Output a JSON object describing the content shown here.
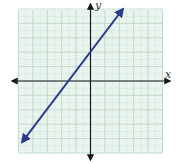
{
  "chart_data": {
    "type": "line",
    "title": "",
    "xlabel": "x",
    "ylabel": "y",
    "xlim": [
      -10,
      10
    ],
    "ylim": [
      -10,
      10
    ],
    "grid": true,
    "grid_minor_step": 1,
    "grid_major_step": 2,
    "tick_labels": false,
    "series": [
      {
        "name": "line",
        "description": "straight line with arrows on both ends, y ≈ (4/3)x + 4",
        "x_intercept": -3,
        "y_intercept": 4,
        "slope": 1.333,
        "endpoints": [
          [
            -9.5,
            -8.5
          ],
          [
            4.5,
            10
          ]
        ],
        "color": "#2b3a8c"
      }
    ]
  },
  "labels": {
    "x_axis": "x",
    "y_axis": "y"
  },
  "colors": {
    "grid_background": "#eaf4ee",
    "grid_line": "#b9d3c3",
    "axis": "#1a1a1a",
    "line": "#2b3a8c"
  }
}
